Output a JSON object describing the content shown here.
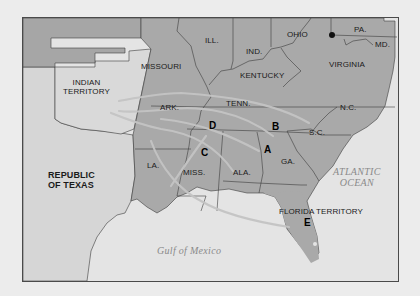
{
  "map": {
    "colors": {
      "background": "#ececec",
      "water": "#e4e4e4",
      "us_states": "#a9a9a9",
      "territory_light": "#d6d6d6",
      "border": "#3c3c3c",
      "route": "#c6c6c6",
      "marker_dot": "#111111"
    },
    "states": [
      {
        "id": "missouri",
        "label": "MISSOURI"
      },
      {
        "id": "illinois",
        "label": "ILL."
      },
      {
        "id": "indiana",
        "label": "IND."
      },
      {
        "id": "ohio",
        "label": "OHIO"
      },
      {
        "id": "pennsylvania",
        "label": "PA."
      },
      {
        "id": "maryland",
        "label": "MD."
      },
      {
        "id": "kentucky",
        "label": "KENTUCKY"
      },
      {
        "id": "virginia",
        "label": "VIRGINIA"
      },
      {
        "id": "arkansas",
        "label": "ARK."
      },
      {
        "id": "tennessee",
        "label": "TENN."
      },
      {
        "id": "north-carolina",
        "label": "N.C."
      },
      {
        "id": "south-carolina",
        "label": "S.C."
      },
      {
        "id": "georgia",
        "label": "GA."
      },
      {
        "id": "alabama",
        "label": "ALA."
      },
      {
        "id": "mississippi",
        "label": "MISS."
      },
      {
        "id": "louisiana",
        "label": "LA."
      }
    ],
    "territories": [
      {
        "id": "indian-territory",
        "label_line1": "INDIAN",
        "label_line2": "TERRITORY"
      },
      {
        "id": "republic-of-texas",
        "label_line1": "REPUBLIC",
        "label_line2": "OF TEXAS"
      },
      {
        "id": "florida-territory",
        "label": "FLORIDA TERRITORY"
      }
    ],
    "water_bodies": [
      {
        "id": "atlantic-ocean",
        "label_line1": "ATLANTIC",
        "label_line2": "OCEAN"
      },
      {
        "id": "gulf-of-mexico",
        "label": "Gulf of Mexico"
      }
    ],
    "markers": [
      {
        "id": "A",
        "label": "A"
      },
      {
        "id": "B",
        "label": "B"
      },
      {
        "id": "C",
        "label": "C"
      },
      {
        "id": "D",
        "label": "D"
      },
      {
        "id": "E",
        "label": "E"
      }
    ]
  }
}
